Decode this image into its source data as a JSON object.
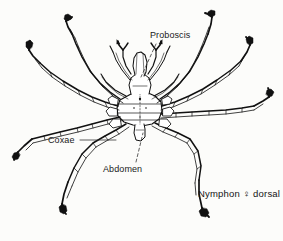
{
  "figure": {
    "organism": "Nymphon",
    "view": "dorsal",
    "sex_symbol": "♀",
    "style": "line drawing, black ink on off-white paper",
    "colors": {
      "background": "#fcfcfa",
      "ink": "#111111",
      "leader_line": "#333333"
    },
    "labels": [
      {
        "id": "proboscis",
        "text": "Proboscis",
        "x": 150,
        "y": 31,
        "leader": {
          "from_x": 157,
          "from_y": 44,
          "to_x": 140,
          "to_y": 76,
          "style": "dashed"
        }
      },
      {
        "id": "coxae",
        "text": "Coxae",
        "x": 48,
        "y": 136,
        "leader": {
          "from_x": 80,
          "from_y": 140,
          "to_x": 116,
          "to_y": 140,
          "style": "solid"
        }
      },
      {
        "id": "abdomen",
        "text": "Abdomen",
        "x": 103,
        "y": 165,
        "leader": {
          "from_x": 136,
          "from_y": 162,
          "to_x": 143,
          "to_y": 132,
          "style": "dashed"
        }
      }
    ],
    "caption": {
      "id": "species-caption",
      "text": "Nymphon ♀ dorsal",
      "x": 198,
      "y": 189
    },
    "anatomy_parts": [
      "proboscis",
      "chelifores",
      "palps",
      "oviger",
      "cephalon",
      "trunk-segments",
      "coxae",
      "femur",
      "tibia",
      "tarsus",
      "propodus",
      "terminal-claw",
      "abdomen"
    ],
    "leg_count": 8
  }
}
